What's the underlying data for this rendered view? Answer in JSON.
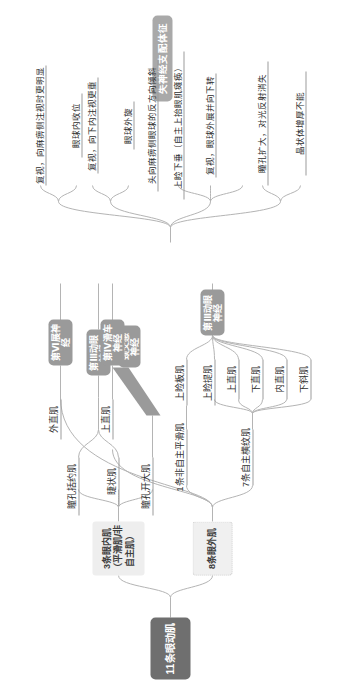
{
  "diagram": {
    "type": "mindmap",
    "orientation": "rotated-90-ccw",
    "root": {
      "label": "11条眼动肌"
    },
    "denervation_header": {
      "label": "失神经支配体征"
    },
    "groups": [
      {
        "id": "inner",
        "label": "3条眼内肌\n（平滑肌/非自主肌）"
      },
      {
        "id": "outer",
        "label": "8条眼外肌"
      }
    ],
    "subgroups": [
      {
        "id": "smooth",
        "label": "1条非自主平滑肌"
      },
      {
        "id": "striated",
        "label": "7条自主横纹肌"
      }
    ],
    "nerves": [
      {
        "id": "n3a",
        "label": "第Ⅲ动眼神经"
      },
      {
        "id": "symp",
        "label": "颈交感神经"
      },
      {
        "id": "n3b",
        "label": "第Ⅲ动眼神经"
      },
      {
        "id": "n4",
        "label": "第Ⅳ滑车神经"
      },
      {
        "id": "n6",
        "label": "第Ⅵ展神经"
      }
    ],
    "muscles": {
      "inner": [
        "瞳孔括约肌",
        "睫状肌",
        "瞳孔开大肌"
      ],
      "smooth": [
        "上睑板肌"
      ],
      "striated": [
        "上睑提肌",
        "上直肌",
        "下直肌",
        "内直肌",
        "下斜肌"
      ],
      "n4": [
        "上直肌"
      ],
      "n6": [
        "外直肌"
      ]
    },
    "signs": {
      "n3a": [
        "瞳孔扩大，对光反射消失",
        "晶状体增厚不能"
      ],
      "n3b": [
        "上睑下垂（自主上抬眼肌瘫痪）",
        "复视，眼球外展并向下转"
      ],
      "n4": [
        "复视，向下内注视更重",
        "眼球外旋",
        "头向麻痹侧眼球的反方向倾斜"
      ],
      "n6": [
        "复视，向麻痹侧注视时更明显",
        "眼球内收位"
      ]
    },
    "colors": {
      "root": "#6f6f6f",
      "nerve": "#9a9a9a",
      "sign_header": "#a9a9a9",
      "group_fill": "#eeeeee",
      "line": "#b4b4b4",
      "text": "#2e2e2e"
    }
  }
}
